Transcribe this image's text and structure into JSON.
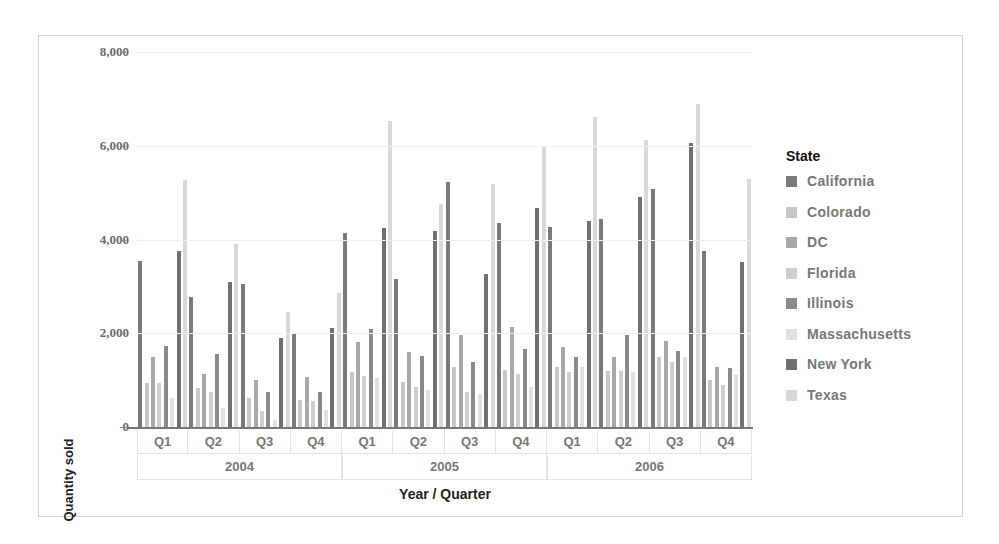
{
  "chart_data": {
    "type": "bar",
    "title": "",
    "xlabel": "Year / Quarter",
    "ylabel": "Quantity sold",
    "ylim": [
      0,
      8000
    ],
    "yticks": [
      0,
      2000,
      4000,
      6000,
      8000
    ],
    "ytick_labels": [
      "0",
      "2,000",
      "4,000",
      "6,000",
      "8,000"
    ],
    "grid": true,
    "legend_position": "right",
    "legend_title": "State",
    "x_levels": {
      "years": [
        "2004",
        "2005",
        "2006"
      ],
      "quarters": [
        "Q1",
        "Q2",
        "Q3",
        "Q4"
      ]
    },
    "categories": [
      "2004 Q1",
      "2004 Q2",
      "2004 Q3",
      "2004 Q4",
      "2005 Q1",
      "2005 Q2",
      "2005 Q3",
      "2005 Q4",
      "2006 Q1",
      "2006 Q2",
      "2006 Q3",
      "2006 Q4"
    ],
    "series": [
      {
        "name": "California",
        "color": "#7a7a7a",
        "values": [
          3540,
          2770,
          3050,
          1980,
          4140,
          3160,
          5230,
          4350,
          4270,
          4430,
          5070,
          3750
        ]
      },
      {
        "name": "Colorado",
        "color": "#c8c8c8",
        "values": [
          940,
          830,
          620,
          580,
          1170,
          960,
          1280,
          1210,
          1280,
          1190,
          1490,
          1000
        ]
      },
      {
        "name": "DC",
        "color": "#a8a8a8",
        "values": [
          1490,
          1130,
          1000,
          1070,
          1810,
          1600,
          1960,
          2130,
          1710,
          1490,
          1830,
          1280
        ]
      },
      {
        "name": "Florida",
        "color": "#cfcfcf",
        "values": [
          940,
          750,
          340,
          550,
          1090,
          850,
          750,
          1130,
          1170,
          1190,
          1390,
          900
        ]
      },
      {
        "name": "Illinois",
        "color": "#8a8a8a",
        "values": [
          1730,
          1550,
          750,
          750,
          2090,
          1510,
          1390,
          1660,
          1490,
          1960,
          1620,
          1260
        ]
      },
      {
        "name": "Massachusetts",
        "color": "#e0e0e0",
        "values": [
          620,
          410,
          150,
          360,
          1050,
          800,
          700,
          850,
          1280,
          1170,
          1490,
          1110
        ]
      },
      {
        "name": "New York",
        "color": "#707070",
        "values": [
          3750,
          3090,
          1900,
          2110,
          4240,
          4180,
          3260,
          4670,
          4390,
          4900,
          6050,
          3520
        ]
      },
      {
        "name": "Texas",
        "color": "#d8d8d8",
        "values": [
          5270,
          3900,
          2450,
          2860,
          6520,
          4750,
          5180,
          5990,
          6610,
          6120,
          6890,
          5290
        ]
      }
    ]
  }
}
